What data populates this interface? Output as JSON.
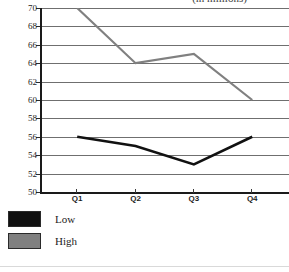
{
  "chart_data": {
    "type": "line",
    "title": "(in millions)",
    "xlabel": "",
    "ylabel": "",
    "categories": [
      "Q1",
      "Q2",
      "Q3",
      "Q4"
    ],
    "series": [
      {
        "name": "Low",
        "values": [
          56,
          55,
          53,
          56
        ],
        "color": "#111111"
      },
      {
        "name": "High",
        "values": [
          70,
          64,
          65,
          60
        ],
        "color": "#808080"
      }
    ],
    "ylim": [
      50,
      70
    ],
    "yticks": [
      70,
      68,
      66,
      64,
      62,
      60,
      58,
      56,
      54,
      52,
      50
    ],
    "ytick_labels": [
      "70",
      "68",
      "66",
      "64",
      "62",
      "60",
      "58",
      "56",
      "54",
      "52",
      "50"
    ],
    "grid": true,
    "grid_axis": "y",
    "legend_position": "below-left"
  },
  "legend": {
    "items": [
      {
        "label": "Low",
        "color": "#111111"
      },
      {
        "label": "High",
        "color": "#808080"
      }
    ]
  },
  "colors": {
    "low": "#111111",
    "high": "#808080",
    "gridline": "#6f6f6f",
    "axis": "#1a1a1a",
    "background": "#ffffff",
    "text": "#1c1c1c"
  }
}
